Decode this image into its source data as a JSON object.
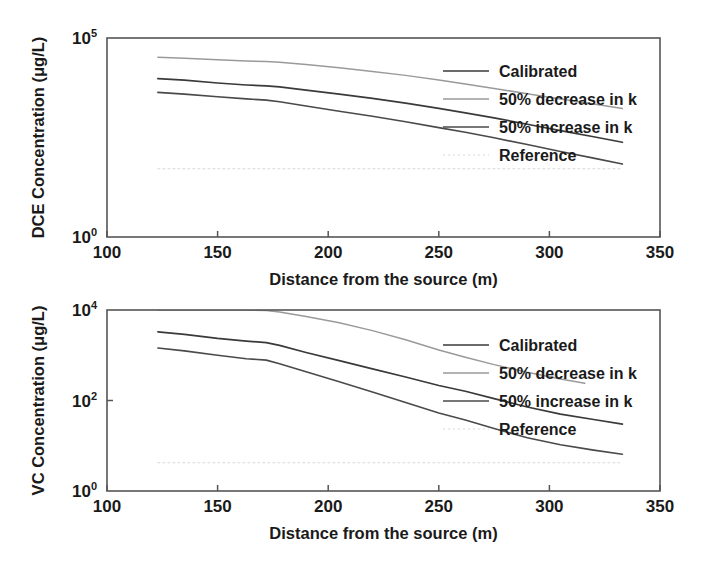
{
  "figure": {
    "background": "#ffffff",
    "panel_count": 2
  },
  "chart_data": [
    {
      "type": "line",
      "id": "dce-panel",
      "title": "",
      "xlabel": "Distance from the source (m)",
      "ylabel": "DCE Concentration (μg/L)",
      "xlim": [
        100,
        350
      ],
      "ylim": [
        1,
        100000
      ],
      "yscale": "log",
      "xticks": [
        100,
        150,
        200,
        250,
        300,
        350
      ],
      "xticklabels": [
        "100",
        "150",
        "200",
        "250",
        "300",
        "350"
      ],
      "yticks": [
        1,
        100000
      ],
      "yticklabels": [
        "10^0",
        "10^5"
      ],
      "ytick_bases": [
        "10",
        "10"
      ],
      "ytick_exps": [
        "0",
        "5"
      ],
      "grid": false,
      "legend_position": "upper right",
      "legend": [
        "Calibrated",
        "50% decrease in k",
        "50% increase in k",
        "Reference"
      ],
      "series": [
        {
          "name": "Calibrated",
          "color": "#3a3a3a",
          "width": 1.7,
          "dash": "none",
          "x": [
            123,
            135,
            150,
            163,
            172,
            178,
            190,
            205,
            220,
            235,
            250,
            262,
            275,
            290,
            305,
            320,
            333
          ],
          "y": [
            9500,
            8700,
            7400,
            6600,
            6250,
            5900,
            4900,
            3900,
            3050,
            2300,
            1700,
            1320,
            980,
            680,
            470,
            330,
            240
          ]
        },
        {
          "name": "50% decrease in k",
          "color": "#9a9a9a",
          "width": 1.5,
          "dash": "none",
          "x": [
            123,
            135,
            150,
            163,
            172,
            178,
            190,
            205,
            220,
            235,
            250,
            262,
            275,
            290,
            305,
            320,
            333
          ],
          "y": [
            33000,
            31000,
            28500,
            26500,
            25500,
            24500,
            21500,
            18000,
            14500,
            11500,
            8800,
            7000,
            5400,
            4000,
            2950,
            2200,
            1700
          ]
        },
        {
          "name": "50% increase in k",
          "color": "#4a4a4a",
          "width": 1.6,
          "dash": "none",
          "x": [
            123,
            135,
            150,
            163,
            172,
            178,
            190,
            205,
            220,
            235,
            250,
            262,
            275,
            290,
            305,
            320,
            333
          ],
          "y": [
            4300,
            3900,
            3350,
            2950,
            2750,
            2500,
            1950,
            1450,
            1080,
            790,
            560,
            430,
            310,
            210,
            140,
            96,
            68
          ]
        },
        {
          "name": "Reference",
          "color": "#d8d8d8",
          "width": 1.1,
          "dash": "2,3",
          "x": [
            123,
            333
          ],
          "y": [
            52,
            52
          ]
        }
      ]
    },
    {
      "type": "line",
      "id": "vc-panel",
      "title": "",
      "xlabel": "Distance from the source (m)",
      "ylabel": "VC Concentration (μg/L)",
      "xlim": [
        100,
        350
      ],
      "ylim": [
        1,
        10000
      ],
      "yscale": "log",
      "xticks": [
        100,
        150,
        200,
        250,
        300,
        350
      ],
      "xticklabels": [
        "100",
        "150",
        "200",
        "250",
        "300",
        "350"
      ],
      "yticks": [
        1,
        100,
        10000
      ],
      "yticklabels": [
        "10^0",
        "10^2",
        "10^4"
      ],
      "ytick_bases": [
        "10",
        "10",
        "10"
      ],
      "ytick_exps": [
        "0",
        "2",
        "4"
      ],
      "grid": false,
      "legend_position": "upper right",
      "legend": [
        "Calibrated",
        "50% decrease in k",
        "50% increase in k",
        "Reference"
      ],
      "series": [
        {
          "name": "Calibrated",
          "color": "#3a3a3a",
          "width": 1.7,
          "dash": "none",
          "x": [
            123,
            135,
            150,
            163,
            172,
            178,
            190,
            205,
            220,
            235,
            250,
            262,
            275,
            290,
            305,
            320,
            333
          ],
          "y": [
            3300,
            2900,
            2350,
            2050,
            1900,
            1650,
            1150,
            760,
            500,
            330,
            215,
            160,
            110,
            72,
            50,
            38,
            30
          ]
        },
        {
          "name": "50% decrease in k",
          "color": "#9a9a9a",
          "width": 1.5,
          "dash": "none",
          "x": [
            123,
            140,
            160,
            172,
            178,
            190,
            205,
            220,
            235,
            250,
            262,
            275,
            290,
            305,
            316
          ],
          "y": [
            10000,
            10000,
            10000,
            9800,
            9000,
            7200,
            5200,
            3500,
            2200,
            1300,
            900,
            620,
            420,
            300,
            240
          ]
        },
        {
          "name": "50% increase in k",
          "color": "#4a4a4a",
          "width": 1.6,
          "dash": "none",
          "x": [
            123,
            135,
            150,
            163,
            172,
            178,
            190,
            205,
            220,
            235,
            250,
            262,
            275,
            290,
            305,
            320,
            333
          ],
          "y": [
            1450,
            1250,
            1000,
            840,
            780,
            650,
            430,
            260,
            155,
            90,
            53,
            37,
            24,
            15,
            10.5,
            8.0,
            6.5
          ]
        },
        {
          "name": "Reference",
          "color": "#d8d8d8",
          "width": 1.1,
          "dash": "2,3",
          "x": [
            123,
            333
          ],
          "y": [
            4.2,
            4.2
          ]
        }
      ]
    }
  ]
}
